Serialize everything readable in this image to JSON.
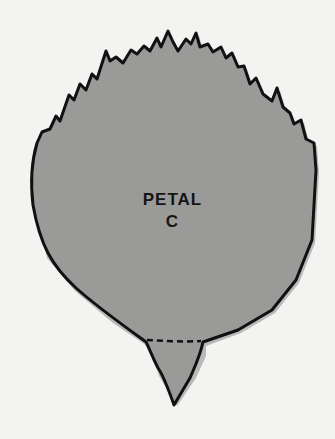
{
  "figure": {
    "title_line1": "PETAL",
    "title_line2": "C",
    "colors": {
      "background": "#f3f3f1",
      "petal_fill": "#9a9a98",
      "outline": "#111111"
    }
  }
}
